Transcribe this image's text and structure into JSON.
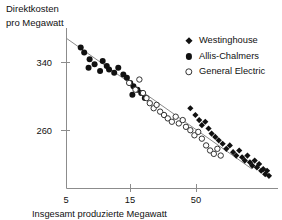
{
  "title": {
    "line1": "Direktkosten",
    "line2": "pro Megawatt"
  },
  "caption": "Insgesamt produzierte Megawatt",
  "legend": {
    "items": [
      {
        "label": "Westinghouse",
        "marker": "filled-diamond-icon",
        "color": "#111111"
      },
      {
        "label": "Allis-Chalmers",
        "marker": "filled-circle-icon",
        "color": "#111111"
      },
      {
        "label": "General Electric",
        "marker": "open-circle-icon",
        "color": "#ffffff"
      }
    ]
  },
  "axes": {
    "y_ticks": [
      "340",
      "260"
    ],
    "x_ticks": [
      "5",
      "15",
      "50"
    ]
  },
  "chart_data": {
    "type": "scatter",
    "title": "Direktkosten pro Megawatt",
    "xlabel": "Insgesamt produzierte Megawatt",
    "ylabel": "Direktkosten pro Megawatt",
    "xscale": "log",
    "yscale": "linear",
    "xlim": [
      4.2,
      120
    ],
    "ylim": [
      205,
      395
    ],
    "xticks": [
      5,
      15,
      50
    ],
    "yticks": [
      260,
      340
    ],
    "grid": false,
    "legend_position": "top-right",
    "trend_line": {
      "label": "Lernkurve",
      "x_start": 5.0,
      "y_start": 372,
      "x_end": 105,
      "y_end": 218,
      "color": "#8a8a8a"
    },
    "series": [
      {
        "name": "Allis-Chalmers",
        "marker": "filled-circle",
        "color": "#111111",
        "points": [
          [
            5.3,
            372
          ],
          [
            5.6,
            366
          ],
          [
            6.1,
            358
          ],
          [
            6.0,
            348
          ],
          [
            6.6,
            352
          ],
          [
            7.2,
            344
          ],
          [
            7.5,
            356
          ],
          [
            8.0,
            350
          ],
          [
            8.3,
            346
          ],
          [
            9.0,
            342
          ],
          [
            9.6,
            348
          ],
          [
            10.4,
            340
          ],
          [
            11.0,
            336
          ],
          [
            11.6,
            330
          ],
          [
            12.2,
            326
          ],
          [
            12.0,
            316
          ],
          [
            13.0,
            322
          ],
          [
            13.8,
            318
          ],
          [
            14.6,
            312
          ]
        ]
      },
      {
        "name": "General Electric",
        "marker": "open-circle",
        "color": "#ffffff",
        "points": [
          [
            11.4,
            330
          ],
          [
            12.6,
            322
          ],
          [
            13.4,
            334
          ],
          [
            14.2,
            318
          ],
          [
            15.0,
            312
          ],
          [
            15.8,
            306
          ],
          [
            16.8,
            300
          ],
          [
            17.6,
            304
          ],
          [
            18.6,
            296
          ],
          [
            19.8,
            292
          ],
          [
            21.0,
            288
          ],
          [
            22.4,
            284
          ],
          [
            23.8,
            290
          ],
          [
            25.0,
            282
          ],
          [
            26.6,
            286
          ],
          [
            28.0,
            278
          ],
          [
            30.0,
            274
          ],
          [
            32.0,
            268
          ],
          [
            34.0,
            272
          ],
          [
            36.0,
            264
          ],
          [
            38.5,
            256
          ],
          [
            41.0,
            250
          ],
          [
            43.5,
            246
          ],
          [
            46.0,
            252
          ],
          [
            48.5,
            244
          ]
        ]
      },
      {
        "name": "Westinghouse",
        "marker": "filled-diamond",
        "color": "#111111",
        "points": [
          [
            30.0,
            300
          ],
          [
            32.5,
            292
          ],
          [
            34.5,
            286
          ],
          [
            36.0,
            280
          ],
          [
            38.0,
            284
          ],
          [
            40.0,
            276
          ],
          [
            42.0,
            270
          ],
          [
            44.5,
            266
          ],
          [
            47.0,
            262
          ],
          [
            50.0,
            258
          ],
          [
            53.0,
            252
          ],
          [
            56.0,
            256
          ],
          [
            59.0,
            248
          ],
          [
            62.0,
            244
          ],
          [
            65.0,
            250
          ],
          [
            68.0,
            242
          ],
          [
            71.0,
            238
          ],
          [
            74.0,
            244
          ],
          [
            77.0,
            236
          ],
          [
            80.0,
            232
          ],
          [
            83.0,
            238
          ],
          [
            86.0,
            230
          ],
          [
            89.0,
            234
          ],
          [
            92.0,
            226
          ],
          [
            95.0,
            228
          ],
          [
            98.0,
            222
          ],
          [
            101.0,
            226
          ],
          [
            104.0,
            220
          ]
        ]
      }
    ]
  }
}
